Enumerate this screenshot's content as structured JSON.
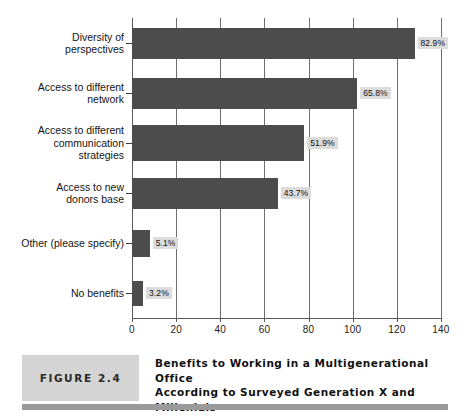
{
  "figure": {
    "badge_label": "FIGURE 2.4",
    "caption": "Benefits to Working in a Multigenerational Office\nAccording to Surveyed Generation X and\nMillenials"
  },
  "chart_data": {
    "type": "bar",
    "orientation": "horizontal",
    "title": "Benefits to Working in a Multigenerational Office According to Surveyed Generation X and Millenials",
    "xlabel": "",
    "ylabel": "",
    "xlim": [
      0,
      140
    ],
    "xticks": [
      "0",
      "20",
      "40",
      "60",
      "80",
      "100",
      "120",
      "140"
    ],
    "grid": true,
    "legend": "none",
    "bar_color": "#4c4c4c",
    "label_background": "#dcdcdc",
    "categories": [
      "Diversity of\nperspectives",
      "Access to different\nnetwork",
      "Access to different\ncommunication\nstrategies",
      "Access to new\ndonors base",
      "Other (please specify)",
      "No benefits"
    ],
    "values": [
      128,
      102,
      78,
      66,
      8,
      5
    ],
    "data_labels": [
      "82.9%",
      "65.8%",
      "51.9%",
      "43.7%",
      "5.1%",
      "3.2%"
    ]
  }
}
